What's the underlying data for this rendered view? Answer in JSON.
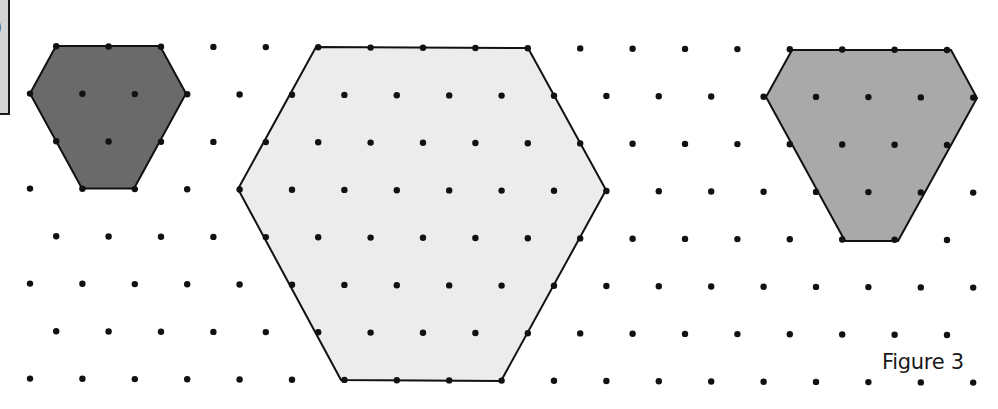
{
  "figure": {
    "label": "Figure 3",
    "corner_box_glyph": ")"
  },
  "grid": {
    "dot_radius": 3.2,
    "dot_color": "#111111",
    "dx": 52.4,
    "rows": [
      {
        "y": 46,
        "x0": 56.2,
        "count": 18
      },
      {
        "y": 93.5,
        "x0": 30,
        "count": 19
      },
      {
        "y": 141,
        "x0": 56.2,
        "count": 18
      },
      {
        "y": 188.5,
        "x0": 30,
        "count": 19
      },
      {
        "y": 236,
        "x0": 56.2,
        "count": 18
      },
      {
        "y": 283.5,
        "x0": 30,
        "count": 19
      },
      {
        "y": 331,
        "x0": 56.2,
        "count": 18
      },
      {
        "y": 378.5,
        "x0": 30,
        "count": 19
      }
    ],
    "tilt": 0.0042
  },
  "shapes": [
    {
      "name": "small-dark-hexagon",
      "fill": "#6a6a6a",
      "stroke": "#111111",
      "points": [
        [
          56,
          46
        ],
        [
          160,
          46
        ],
        [
          186,
          93.5
        ],
        [
          134,
          188.5
        ],
        [
          82,
          188.5
        ],
        [
          30,
          93.5
        ]
      ]
    },
    {
      "name": "large-light-hexagon",
      "fill": "#ececec",
      "stroke": "#111111",
      "points": [
        [
          316,
          47
        ],
        [
          528,
          48
        ],
        [
          606,
          190
        ],
        [
          501,
          381
        ],
        [
          341,
          380
        ],
        [
          238,
          189
        ]
      ]
    },
    {
      "name": "medium-grey-hexagon",
      "fill": "#a9a9a9",
      "stroke": "#111111",
      "points": [
        [
          792,
          50
        ],
        [
          951,
          50
        ],
        [
          977,
          98
        ],
        [
          898,
          241
        ],
        [
          845,
          241
        ],
        [
          766,
          97
        ]
      ]
    }
  ]
}
